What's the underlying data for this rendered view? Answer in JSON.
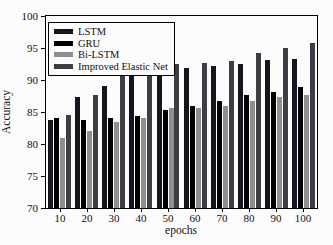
{
  "figure": {
    "background": "#fcfcfc",
    "axis_color": "#000000"
  },
  "chart_data": {
    "type": "bar",
    "title": "",
    "xlabel": "epochs",
    "ylabel": "Accuracy",
    "ylim": [
      70,
      100
    ],
    "yticks": [
      "70",
      "75",
      "80",
      "85",
      "90",
      "95",
      "100"
    ],
    "categories": [
      "10",
      "20",
      "30",
      "40",
      "50",
      "60",
      "70",
      "80",
      "90",
      "100"
    ],
    "series": [
      {
        "name": "LSTM",
        "color": "#15151f",
        "values": [
          83.8,
          87.4,
          89.1,
          90.6,
          91.4,
          91.9,
          92.2,
          92.5,
          93.1,
          93.3
        ]
      },
      {
        "name": "GRU",
        "color": "#000000",
        "values": [
          84.0,
          83.8,
          84.1,
          84.4,
          85.3,
          86.0,
          86.7,
          87.6,
          88.2,
          88.9
        ]
      },
      {
        "name": "Bi-LSTM",
        "color": "#8f8f8f",
        "values": [
          81.0,
          82.1,
          83.5,
          84.1,
          85.6,
          85.6,
          86.0,
          86.8,
          87.3,
          87.7
        ]
      },
      {
        "name": "Improved Elastic Net",
        "color": "#3d3d46",
        "values": [
          84.6,
          87.7,
          90.7,
          92.0,
          92.5,
          92.6,
          93.0,
          94.2,
          95.0,
          95.8
        ]
      }
    ],
    "legend_position": "upper-left",
    "grid": false
  }
}
